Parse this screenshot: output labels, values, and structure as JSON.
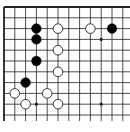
{
  "board": {
    "description": "Go board corner diagram (top-left region of 19x19 board)",
    "origin_x": 4,
    "origin_y": 7,
    "spacing": 10.8,
    "cols": 12,
    "rows": 11,
    "edges": {
      "top": true,
      "left": true,
      "right": false,
      "bottom": false
    },
    "line_color": "#222222",
    "background": "#ffffff",
    "star_points": [
      {
        "col": 3,
        "row": 3
      },
      {
        "col": 9,
        "row": 3
      },
      {
        "col": 3,
        "row": 9
      },
      {
        "col": 9,
        "row": 9
      }
    ],
    "stones": [
      {
        "color": "black",
        "col": 3,
        "row": 2
      },
      {
        "color": "black",
        "col": 3,
        "row": 3
      },
      {
        "color": "black",
        "col": 3,
        "row": 5
      },
      {
        "color": "black",
        "col": 2,
        "row": 7
      },
      {
        "color": "black",
        "col": 10,
        "row": 2
      },
      {
        "color": "white",
        "col": 5,
        "row": 2
      },
      {
        "color": "white",
        "col": 8,
        "row": 2
      },
      {
        "color": "white",
        "col": 5,
        "row": 4
      },
      {
        "color": "white",
        "col": 5,
        "row": 6
      },
      {
        "color": "white",
        "col": 1,
        "row": 8
      },
      {
        "color": "white",
        "col": 4,
        "row": 8
      },
      {
        "color": "white",
        "col": 2,
        "row": 9
      },
      {
        "color": "white",
        "col": 5,
        "row": 9
      }
    ],
    "colors": {
      "black_stone": "#000000",
      "white_stone": "#ffffff",
      "white_outline": "#222222"
    }
  }
}
